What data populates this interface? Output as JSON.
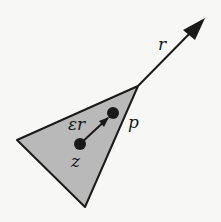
{
  "diagram": {
    "labels": {
      "ray": "r",
      "step": "εr",
      "point_p": "p",
      "point_z": "z"
    },
    "colors": {
      "triangle_fill": "#b9b9b9",
      "stroke": "#1a1a1a",
      "background": "#f7f7f5"
    }
  }
}
